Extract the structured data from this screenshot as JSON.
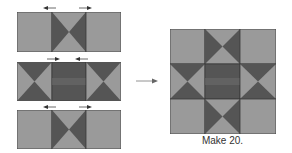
{
  "colors": {
    "light": "#9a9a9a",
    "dark": "#555555",
    "edge": "#3a3a3a",
    "arrow": "#444444"
  },
  "rows": [
    {
      "name": "top-row",
      "units": [
        "plain",
        "hourglass-vertical",
        "plain"
      ],
      "arrows": [
        "left",
        "right"
      ]
    },
    {
      "name": "middle-row",
      "units": [
        "hourglass-horizontal",
        "dark-plain",
        "hourglass-horizontal"
      ],
      "arrows": [
        "right",
        "left"
      ]
    },
    {
      "name": "bottom-row",
      "units": [
        "plain",
        "hourglass-vertical",
        "plain"
      ],
      "arrows": [
        "left",
        "right"
      ]
    }
  ],
  "result_block": {
    "grid": [
      [
        "plain",
        "hourglass-vertical",
        "plain"
      ],
      [
        "hourglass-horizontal",
        "dark-plain",
        "hourglass-horizontal"
      ],
      [
        "plain",
        "hourglass-vertical",
        "plain"
      ]
    ]
  },
  "caption": "Make 20."
}
